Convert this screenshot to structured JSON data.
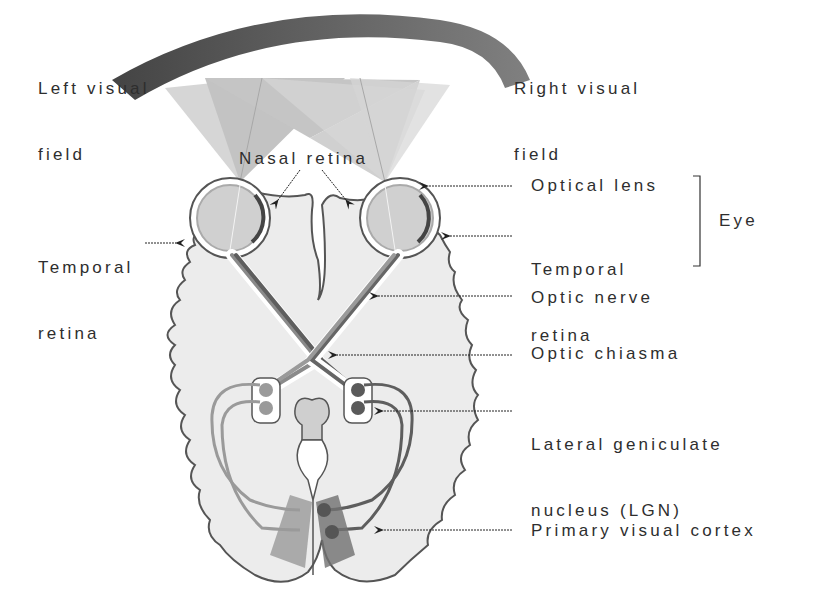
{
  "labels": {
    "left_visual_field": [
      "Left visual",
      "field"
    ],
    "right_visual_field": [
      "Right visual",
      "field"
    ],
    "nasal_retina": "Nasal retina",
    "temporal_retina_left": [
      "Temporal",
      "retina"
    ],
    "optical_lens": "Optical lens",
    "temporal_retina_right": [
      "Temporal",
      "retina"
    ],
    "eye": "Eye",
    "optic_nerve": "Optic nerve",
    "optic_chiasma": "Optic chiasma",
    "lgn": [
      "Lateral geniculate",
      "nucleus (LGN)"
    ],
    "primary_visual_cortex": "Primary visual cortex"
  },
  "colors": {
    "visual_field_left": "#4a4a4a",
    "visual_field_right": "#7a7a7a",
    "brain_fill": "#ebebeb",
    "outline": "#555555",
    "left_pathway": "#9a9a9a",
    "right_pathway": "#5e5e5e",
    "cone_light": "#cfcfcf",
    "cone_dark": "#b5b5b5"
  }
}
